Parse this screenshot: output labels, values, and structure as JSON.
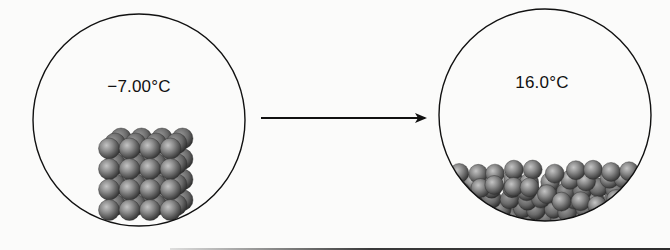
{
  "diagram": {
    "type": "phase-change-illustration",
    "states": [
      {
        "name": "solid",
        "temperature_label": "−7.00°C",
        "arrangement": "ordered cubic lattice"
      },
      {
        "name": "liquid",
        "temperature_label": "16.0°C",
        "arrangement": "disordered pool at bottom"
      }
    ],
    "arrow": {
      "direction": "right",
      "from": "solid",
      "to": "liquid"
    },
    "colors": {
      "background": "#fbfbfa",
      "outline": "#111111",
      "sphere_light": "#b5b5b5",
      "sphere_mid": "#7a7a7a",
      "sphere_dark": "#3c3c3c"
    }
  }
}
